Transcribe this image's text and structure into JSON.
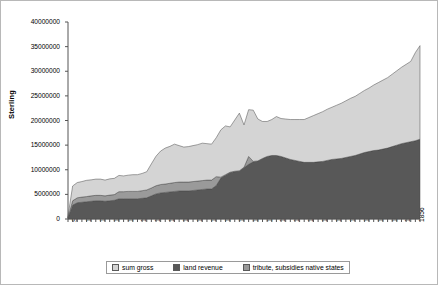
{
  "chart_data": {
    "type": "area",
    "stacked": true,
    "title": "",
    "xlabel": "",
    "ylabel": "Sterling",
    "ylim": [
      0,
      40000000
    ],
    "ytick_labels": [
      "0",
      "5000000",
      "10000000",
      "15000000",
      "20000000",
      "25000000",
      "30000000",
      "35000000",
      "40000000"
    ],
    "ytick_values": [
      0,
      5000000,
      10000000,
      15000000,
      20000000,
      25000000,
      30000000,
      35000000,
      40000000
    ],
    "grid": false,
    "legend_position": "bottom",
    "xlim": [
      1783,
      1859
    ],
    "x_first_tick_label": "Sterling",
    "xtick_labels": [
      "Sterling",
      "1784",
      "1787",
      "1790",
      "1793",
      "1796",
      "1799",
      "1802",
      "1805",
      "1808",
      "1811",
      "1814",
      "1817",
      "1820",
      "1823",
      "1826",
      "1829",
      "1832",
      "1835",
      "1838",
      "1841",
      "1844",
      "1847",
      "1850",
      "1853",
      "1856",
      "1859"
    ],
    "x": [
      1783,
      1784,
      1785,
      1786,
      1787,
      1788,
      1789,
      1790,
      1791,
      1792,
      1793,
      1794,
      1795,
      1796,
      1797,
      1798,
      1799,
      1800,
      1801,
      1802,
      1803,
      1804,
      1805,
      1806,
      1807,
      1808,
      1809,
      1810,
      1811,
      1812,
      1813,
      1814,
      1815,
      1816,
      1817,
      1818,
      1819,
      1820,
      1821,
      1822,
      1823,
      1824,
      1825,
      1826,
      1827,
      1828,
      1829,
      1830,
      1831,
      1832,
      1833,
      1834,
      1835,
      1836,
      1837,
      1838,
      1839,
      1840,
      1841,
      1842,
      1843,
      1844,
      1845,
      1846,
      1847,
      1848,
      1849,
      1850,
      1851,
      1852,
      1853,
      1854,
      1855,
      1856,
      1857,
      1858,
      1859
    ],
    "series": [
      {
        "name": "land revenue",
        "color": "#585858",
        "values": [
          200000,
          2800000,
          3300000,
          3400000,
          3500000,
          3600000,
          3700000,
          3700000,
          3600000,
          3700000,
          3800000,
          4100000,
          4100000,
          4100000,
          4100000,
          4100000,
          4200000,
          4300000,
          4700000,
          5100000,
          5300000,
          5400000,
          5500000,
          5600000,
          5700000,
          5700000,
          5700000,
          5800000,
          5900000,
          6000000,
          6100000,
          6100000,
          6800000,
          8300000,
          8900000,
          9400000,
          9600000,
          9700000,
          10400000,
          11100000,
          11600000,
          11800000,
          12300000,
          12700000,
          12900000,
          12900000,
          12700000,
          12400000,
          12100000,
          11900000,
          11700000,
          11500000,
          11500000,
          11500000,
          11600000,
          11700000,
          11900000,
          12100000,
          12200000,
          12300000,
          12500000,
          12700000,
          12900000,
          13200000,
          13500000,
          13700000,
          13900000,
          14000000,
          14200000,
          14400000,
          14700000,
          15000000,
          15300000,
          15500000,
          15700000,
          15900000,
          16200000
        ]
      },
      {
        "name": "tribute, subsidies native states",
        "color": "#9a9a9a",
        "values": [
          100000,
          900000,
          1000000,
          1050000,
          1050000,
          1100000,
          1100000,
          1100000,
          1100000,
          1150000,
          1150000,
          1450000,
          1450000,
          1500000,
          1500000,
          1500000,
          1550000,
          1600000,
          1600000,
          1650000,
          1700000,
          1700000,
          1750000,
          1800000,
          1800000,
          1800000,
          1800000,
          1800000,
          1800000,
          1800000,
          1800000,
          1800000,
          1800000,
          200000,
          100000,
          100000,
          100000,
          100000,
          100000,
          1600000,
          100000,
          0,
          0,
          0,
          0,
          0,
          0,
          0,
          0,
          0,
          0,
          0,
          0,
          0,
          0,
          0,
          0,
          0,
          0,
          0,
          0,
          0,
          0,
          0,
          0,
          0,
          0,
          0,
          0,
          0,
          0,
          0,
          0,
          0,
          0,
          0,
          0
        ]
      },
      {
        "name": "sum gross",
        "color": "#d4d4d4",
        "values": [
          300000,
          3000000,
          3100000,
          3150000,
          3300000,
          3250000,
          3300000,
          3300000,
          3200000,
          3300000,
          3300000,
          3300000,
          3200000,
          3300000,
          3400000,
          3400000,
          3500000,
          3700000,
          4900000,
          6000000,
          6800000,
          7300000,
          7500000,
          7800000,
          7400000,
          7100000,
          7200000,
          7300000,
          7400000,
          7600000,
          7400000,
          7300000,
          7900000,
          9600000,
          9900000,
          9200000,
          10400000,
          11700000,
          8600000,
          9500000,
          10400000,
          8500000,
          7500000,
          7100000,
          7300000,
          7900000,
          7700000,
          7900000,
          8100000,
          8300000,
          8500000,
          8700000,
          9100000,
          9500000,
          9800000,
          10100000,
          10400000,
          10600000,
          10900000,
          11200000,
          11500000,
          11800000,
          12000000,
          12300000,
          12600000,
          12900000,
          13300000,
          13700000,
          14000000,
          14300000,
          14700000,
          15100000,
          15500000,
          15900000,
          16300000,
          17900000,
          19000000
        ]
      }
    ],
    "legend": [
      {
        "label": "sum gross",
        "color": "#d4d4d4"
      },
      {
        "label": "land revenue",
        "color": "#585858"
      },
      {
        "label": "tribute, subsidies native states",
        "color": "#9a9a9a"
      }
    ]
  }
}
